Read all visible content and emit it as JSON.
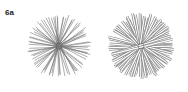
{
  "figure": {
    "label": "6a",
    "panels": [
      {
        "name": "thin-line-starburst",
        "cx": 59,
        "cy": 46,
        "r": 33,
        "rays": 40,
        "stroke": "#777777",
        "width": 0.6
      },
      {
        "name": "tube-starburst",
        "cx": 141,
        "cy": 46,
        "r": 34,
        "rays": 40,
        "stroke": "#8a8a8a",
        "width": 2.6,
        "fill": "#ffffff"
      }
    ]
  }
}
